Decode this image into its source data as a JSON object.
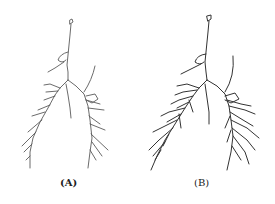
{
  "figure": {
    "panels": [
      {
        "label": "(A)",
        "description": "airway tree skeleton, sparse"
      },
      {
        "label": "(B)",
        "description": "airway tree skeleton, dense"
      }
    ],
    "colors": {
      "line_a": "#555555",
      "line_b": "#333333",
      "background": "#ffffff"
    }
  }
}
